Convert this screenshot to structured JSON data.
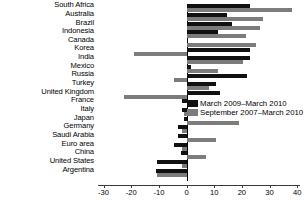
{
  "chart_data": {
    "type": "bar",
    "orientation": "horizontal",
    "title": "",
    "subtitle": "",
    "xlabel": "",
    "ylabel": "",
    "xlim": [
      -32,
      41
    ],
    "xticks": [
      -30,
      -20,
      -10,
      0,
      10,
      20,
      30,
      40
    ],
    "xtick_labels": [
      "-30",
      "-20",
      "-10",
      "0",
      "10",
      "20",
      "30",
      "40"
    ],
    "grid": false,
    "legend_position": "center-right",
    "categories": [
      "South Africa",
      "Australia",
      "Brazil",
      "Indonesia",
      "Canada",
      "Korea",
      "India",
      "Mexico",
      "Russia",
      "Turkey",
      "United Kingdom",
      "France",
      "Italy",
      "Japan",
      "Germany",
      "Saudi Arabia",
      "Euro area",
      "China",
      "United States",
      "Argentina"
    ],
    "series": [
      {
        "name": "March 2009–March 2010",
        "color": "#111111",
        "values": [
          23.0,
          14.5,
          16.5,
          11.5,
          0.5,
          23.0,
          23.0,
          1.5,
          22.0,
          10.5,
          12.0,
          -1.5,
          -1.5,
          -1.0,
          -3.0,
          -3.0,
          -4.5,
          -2.0,
          -10.5,
          -11.0
        ]
      },
      {
        "name": "September 2007–March 2010",
        "color": "#7c7c7c",
        "values": [
          38.0,
          27.5,
          26.5,
          21.5,
          25.0,
          -19.0,
          20.5,
          11.5,
          -4.5,
          8.0,
          -22.5,
          2.0,
          -1.0,
          19.0,
          -1.5,
          10.5,
          -1.5,
          7.0,
          -1.5,
          -10.5
        ]
      }
    ]
  },
  "legend": {
    "items": [
      {
        "label": "March 2009–March 2010",
        "color": "#111111"
      },
      {
        "label": "September 2007–March 2010",
        "color": "#7c7c7c"
      }
    ]
  }
}
